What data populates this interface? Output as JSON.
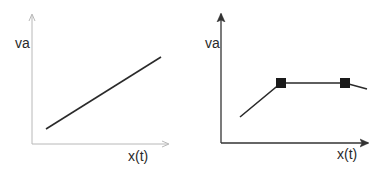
{
  "left_plot": {
    "y_label": "va",
    "x_label": "x(t)",
    "axis_color": "#b8b8b8",
    "line_color": "#2a2a2a",
    "description": "straight increasing line"
  },
  "right_plot": {
    "y_label": "va",
    "x_label": "x(t)",
    "axis_color": "#333333",
    "line_color": "#2a2a2a",
    "description": "increasing line to plateau marked by two square markers, then slight decrease",
    "markers": [
      "square",
      "square"
    ]
  }
}
